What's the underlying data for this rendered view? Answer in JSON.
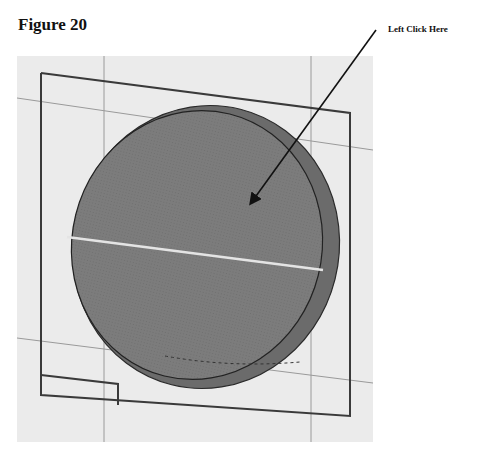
{
  "figure": {
    "title": "Figure 20",
    "callout_label": "Left Click Here"
  },
  "viewport": {
    "background": "#ebebeb",
    "disc_face_color": "#7a7a7a",
    "disc_rim_color": "#6a6a6a",
    "highlight_line_color": "#e0e0e0",
    "outline_color": "#333333",
    "grid_line_color": "#9a9a9a"
  },
  "annotation": {
    "arrow": "arrow-pointing-to-disc-face"
  }
}
